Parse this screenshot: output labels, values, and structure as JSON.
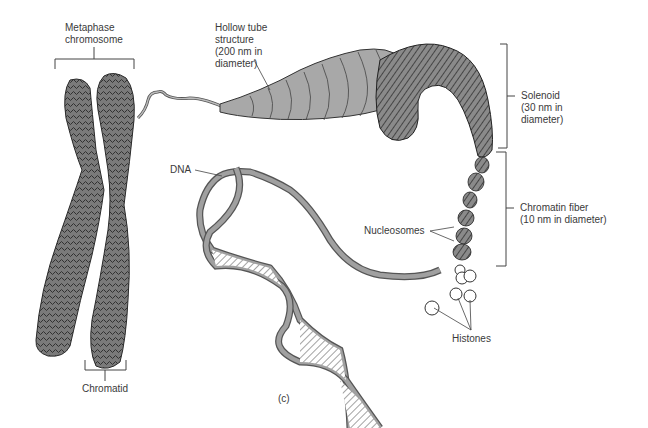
{
  "figure": {
    "panel_label": "(c)",
    "labels": {
      "metaphase": [
        "Metaphase",
        "chromosome"
      ],
      "hollow_tube": [
        "Hollow tube",
        "structure",
        "(200 nm in",
        "diameter)"
      ],
      "solenoid": [
        "Solenoid",
        "(30 nm in",
        "diameter)"
      ],
      "chromatin_fiber": [
        "Chromatin fiber",
        "(10 nm in diameter)"
      ],
      "dna": "DNA",
      "nucleosomes": "Nucleosomes",
      "histones": "Histones",
      "chromatid": "Chromatid"
    },
    "colors": {
      "chromosome_fill": "#6e6e6e",
      "tube_fill": "#a8a8a8",
      "solenoid_fill": "#707070",
      "dna_strand": "#8a8a8a",
      "line": "#333333"
    }
  }
}
